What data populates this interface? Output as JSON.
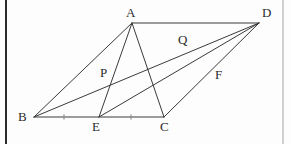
{
  "figure": {
    "type": "geometry-diagram",
    "width": 291,
    "height": 144,
    "background_color": "#fdfdfd",
    "stroke_color": "#3a3a3a",
    "label_color": "#2b2b2b",
    "border_color": "#111111"
  },
  "points": [
    {
      "id": "A",
      "label": "A",
      "x": 132,
      "y": 23,
      "label_x": 126,
      "label_y": 6
    },
    {
      "id": "D",
      "label": "D",
      "x": 259,
      "y": 23,
      "label_x": 262,
      "label_y": 6
    },
    {
      "id": "B",
      "label": "B",
      "x": 34,
      "y": 117,
      "label_x": 18,
      "label_y": 110
    },
    {
      "id": "C",
      "label": "C",
      "x": 164,
      "y": 117,
      "label_x": 160,
      "label_y": 120
    },
    {
      "id": "E",
      "label": "E",
      "x": 99,
      "y": 117,
      "label_x": 92,
      "label_y": 120
    },
    {
      "id": "P",
      "label": "P",
      "x": 110,
      "y": 78,
      "label_x": 100,
      "label_y": 66
    },
    {
      "id": "Q",
      "label": "Q",
      "x": 186,
      "y": 49,
      "label_x": 178,
      "label_y": 33
    },
    {
      "id": "F",
      "label": "F",
      "x": 214,
      "y": 74,
      "label_x": 215,
      "label_y": 68
    }
  ],
  "segments": [
    {
      "id": "AD",
      "from": "A",
      "to": "D",
      "name": "segment-a-d"
    },
    {
      "id": "BC",
      "from": "B",
      "to": "C",
      "name": "segment-b-c"
    },
    {
      "id": "AB",
      "from": "A",
      "to": "B",
      "name": "segment-a-b"
    },
    {
      "id": "CD",
      "from": "C",
      "to": "D",
      "name": "segment-c-d"
    },
    {
      "id": "BD",
      "from": "B",
      "to": "D",
      "name": "segment-b-d-diagonal"
    },
    {
      "id": "AC",
      "from": "A",
      "to": "C",
      "name": "segment-a-c-diagonal"
    },
    {
      "id": "AE",
      "from": "A",
      "to": "E",
      "name": "segment-a-e-cevian"
    },
    {
      "id": "ED",
      "from": "E",
      "to": "D",
      "name": "segment-e-d-cevian"
    }
  ],
  "tick_marks": [
    {
      "id": "tick-be",
      "x": 64,
      "y": 117,
      "on_segment": "BE"
    },
    {
      "id": "tick-ec",
      "x": 131,
      "y": 117,
      "on_segment": "EC"
    }
  ],
  "borders": {
    "left_rule_x": 6,
    "right_rule_x": 283
  }
}
